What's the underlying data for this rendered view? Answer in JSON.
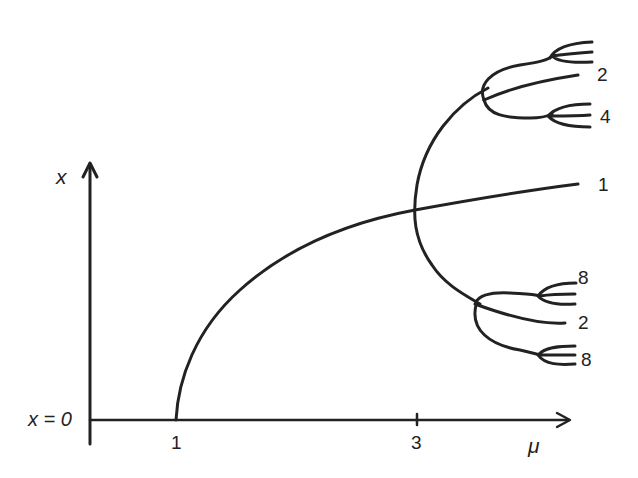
{
  "diagram": {
    "type": "bifurcation-diagram",
    "axes": {
      "y_label": "x",
      "x_label": "μ",
      "origin_label": "x = 0",
      "x_ticks": [
        {
          "value": 1,
          "label": "1"
        },
        {
          "value": 3,
          "label": "3"
        }
      ]
    },
    "branches": [
      {
        "name": "period-1",
        "label": "1",
        "starts_at_mu": 1
      },
      {
        "name": "period-2",
        "label": "2",
        "starts_at_mu": 3
      },
      {
        "name": "period-4",
        "label": "4"
      },
      {
        "name": "period-8",
        "label": "8"
      }
    ],
    "right_labels": {
      "top_2": "2",
      "top_4": "4",
      "mid_1": "1",
      "bottom_8a": "8",
      "bottom_2": "2",
      "bottom_8b": "8"
    },
    "colors": {
      "ink": "#222222",
      "background": "#ffffff"
    }
  }
}
